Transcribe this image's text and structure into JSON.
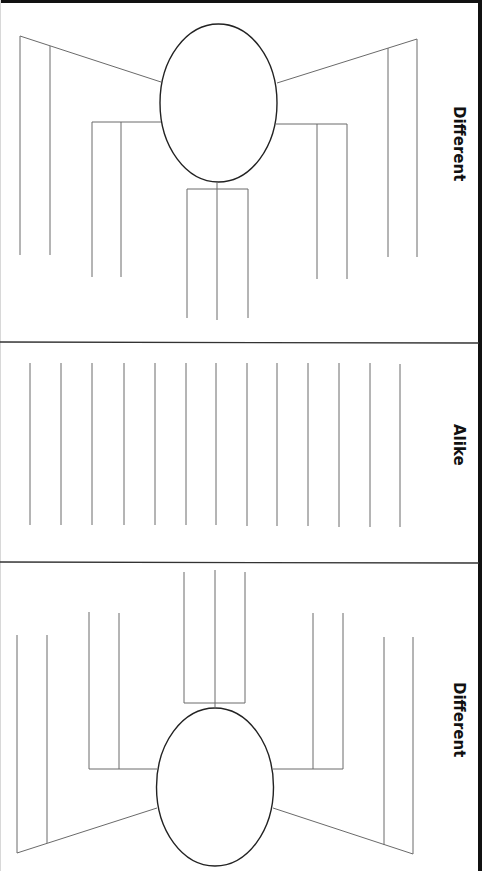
{
  "worksheet": {
    "sections": [
      {
        "id": "top",
        "label": "Different",
        "type": "bubble-map"
      },
      {
        "id": "middle",
        "label": "Alike",
        "type": "lined"
      },
      {
        "id": "bottom",
        "label": "Different",
        "type": "bubble-map"
      }
    ]
  },
  "colors": {
    "line": "#6a6a6a",
    "ellipse": "#222222",
    "divider": "#333333",
    "frame": "#111111",
    "text": "#111111"
  }
}
